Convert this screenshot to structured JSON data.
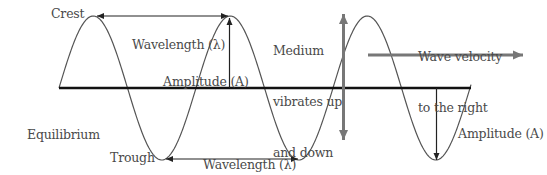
{
  "diagram": {
    "labels": {
      "crest": "Crest",
      "trough": "Trough",
      "equilibrium": [
        "Equilibrium",
        "position"
      ],
      "wavelength_top": "Wavelength (λ)",
      "wavelength_bottom": "Wavelength (λ)",
      "amplitude_left": "Amplitude (A)",
      "amplitude_right": "Amplitude (A)",
      "medium": [
        "Medium",
        "vibrates up",
        "and down"
      ],
      "velocity": [
        "Wave velocity",
        "to the right"
      ]
    },
    "colors": {
      "wave": "#555555",
      "baseline": "#111111",
      "arrow_dark": "#222222",
      "arrow_gray": "#777777",
      "text": "#4a4a4a"
    },
    "geometry": {
      "baseline_y": 88,
      "baseline_x": [
        59,
        471
      ],
      "wave_start_x": 59,
      "half_period_px": 68.5,
      "amplitude_px": 72,
      "crests_x": [
        95,
        230,
        370
      ],
      "troughs_x": [
        164,
        300,
        436
      ]
    }
  }
}
